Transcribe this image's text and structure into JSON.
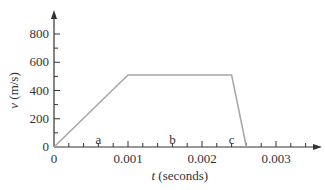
{
  "chart_data": {
    "type": "line",
    "title": "",
    "xlabel_var": "t",
    "xlabel_unit": "(seconds)",
    "ylabel_var": "v",
    "ylabel_unit": "(m/s)",
    "x": [
      0,
      0.001,
      0.0024,
      0.0026
    ],
    "y": [
      0,
      510,
      510,
      0
    ],
    "xlim": [
      0,
      0.0035
    ],
    "ylim": [
      0,
      900
    ],
    "x_ticks": [
      "0",
      "0.001",
      "0.002",
      "0.003"
    ],
    "y_ticks": [
      "0",
      "200",
      "400",
      "600",
      "800"
    ],
    "grid": false,
    "annotations": [
      {
        "text": "a",
        "x": 0.0006,
        "y": 50
      },
      {
        "text": "b",
        "x": 0.0016,
        "y": 50
      },
      {
        "text": "c",
        "x": 0.0024,
        "y": 50
      }
    ],
    "line_color": "#a8a8a8"
  }
}
